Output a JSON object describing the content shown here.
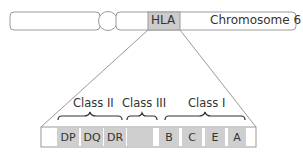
{
  "chromosome": {
    "label": "Chromosome 6",
    "region_label": "HLA"
  },
  "classes": [
    {
      "label": "Class II"
    },
    {
      "label": "Class III"
    },
    {
      "label": "Class I"
    }
  ],
  "genes": [
    {
      "label": "DP"
    },
    {
      "label": "DQ"
    },
    {
      "label": "DR"
    },
    {
      "label": ""
    },
    {
      "label": "B"
    },
    {
      "label": "C"
    },
    {
      "label": "E"
    },
    {
      "label": "A"
    }
  ],
  "colors": {
    "outline": "#9a9a9a",
    "gene_fill": "#cfcfcf",
    "hla_fill": "#cccccc"
  }
}
